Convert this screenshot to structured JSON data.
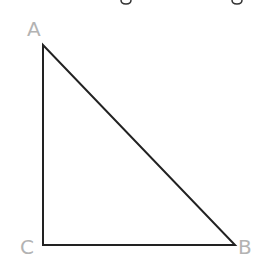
{
  "diagram": {
    "type": "right-triangle",
    "stroke_color": "#222222",
    "label_color": "#b3b3b3",
    "stroke_width": 2,
    "vertices": {
      "A": {
        "x": 43,
        "y": 45,
        "label": "A"
      },
      "B": {
        "x": 235,
        "y": 245,
        "label": "B"
      },
      "C": {
        "x": 43,
        "y": 245,
        "label": "C"
      }
    },
    "right_angle_at": "C",
    "edges": [
      {
        "from": "A",
        "to": "C"
      },
      {
        "from": "C",
        "to": "B"
      },
      {
        "from": "B",
        "to": "A"
      }
    ]
  }
}
